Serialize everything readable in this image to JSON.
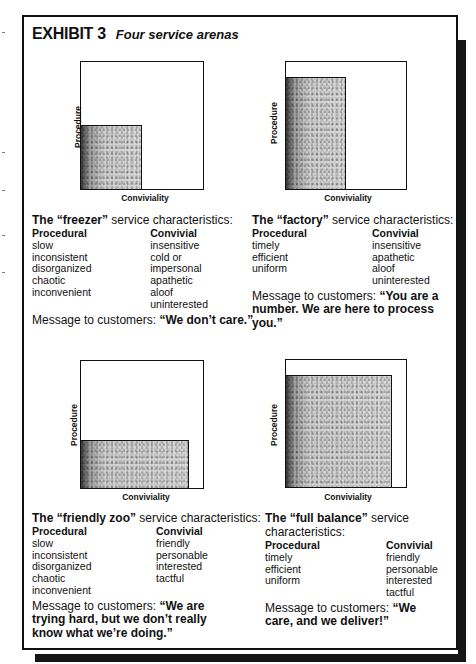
{
  "exhibit": {
    "number": "EXHIBIT 3",
    "title": "Four service arenas"
  },
  "axes": {
    "y_label": "Procedure",
    "x_label": "Conviviality"
  },
  "arenas": [
    {
      "name": "freezer",
      "head_prefix": "The ",
      "head_name": "“freezer”",
      "head_suffix": " service characteristics:",
      "procedural_header": "Procedural",
      "convivial_header": "Convivial",
      "procedural": [
        "slow",
        "inconsistent",
        "disorganized",
        "chaotic",
        "inconvenient"
      ],
      "convivial": [
        "insensitive",
        "cold or impersonal",
        "apathetic",
        "aloof",
        "uninterested"
      ],
      "message_prefix": "Message to customers: ",
      "message": "“We don’t care.”",
      "procedure_level": "low",
      "conviviality_level": "low"
    },
    {
      "name": "factory",
      "head_prefix": "The ",
      "head_name": "“factory”",
      "head_suffix": " service characteristics:",
      "procedural_header": "Procedural",
      "convivial_header": "Convivial",
      "procedural": [
        "timely",
        "efficient",
        "uniform"
      ],
      "convivial": [
        "insensitive",
        "apathetic",
        "aloof",
        "uninterested"
      ],
      "message_prefix": "Message to customers: ",
      "message": "“You are a number. We are here to process you.”",
      "procedure_level": "high",
      "conviviality_level": "low"
    },
    {
      "name": "friendly zoo",
      "head_prefix": "The ",
      "head_name": "“friendly zoo”",
      "head_suffix": " service characteristics:",
      "procedural_header": "Procedural",
      "convivial_header": "Convivial",
      "procedural": [
        "slow",
        "inconsistent",
        "disorganized",
        "chaotic",
        "inconvenient"
      ],
      "convivial": [
        "friendly",
        "personable",
        "interested",
        "tactful"
      ],
      "message_prefix": "Message to customers: ",
      "message": "“We are trying hard, but we don’t really know what we’re doing.”",
      "procedure_level": "low",
      "conviviality_level": "high"
    },
    {
      "name": "full balance",
      "head_prefix": "The ",
      "head_name": "“full balance”",
      "head_suffix": " service characteristics:",
      "procedural_header": "Procedural",
      "convivial_header": "Convivial",
      "procedural": [
        "timely",
        "efficient",
        "uniform"
      ],
      "convivial": [
        "friendly",
        "personable",
        "interested",
        "tactful"
      ],
      "message_prefix": "Message to customers: ",
      "message": "“We care, and we deliver!”",
      "procedure_level": "high",
      "conviviality_level": "high"
    }
  ],
  "colors": {
    "ink": "#111111",
    "paper": "#ffffff",
    "shadow": "#151515"
  }
}
